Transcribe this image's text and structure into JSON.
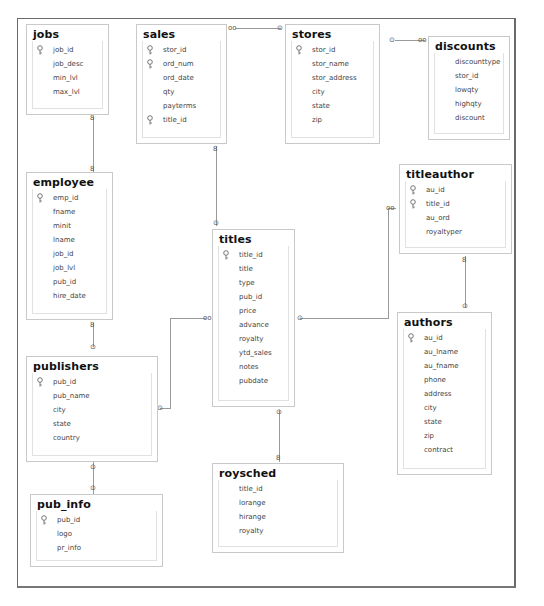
{
  "diagram": {
    "type": "database-schema",
    "tables": [
      {
        "id": "jobs",
        "name": "jobs",
        "columns": [
          {
            "name": "job_id",
            "pk": true
          },
          {
            "name": "job_desc",
            "pk": false
          },
          {
            "name": "min_lvl",
            "pk": false
          },
          {
            "name": "max_lvl",
            "pk": false
          }
        ]
      },
      {
        "id": "sales",
        "name": "sales",
        "columns": [
          {
            "name": "stor_id",
            "pk": true
          },
          {
            "name": "ord_num",
            "pk": true
          },
          {
            "name": "ord_date",
            "pk": false
          },
          {
            "name": "qty",
            "pk": false
          },
          {
            "name": "payterms",
            "pk": false
          },
          {
            "name": "title_id",
            "pk": true
          }
        ]
      },
      {
        "id": "stores",
        "name": "stores",
        "columns": [
          {
            "name": "stor_id",
            "pk": true
          },
          {
            "name": "stor_name",
            "pk": false
          },
          {
            "name": "stor_address",
            "pk": false
          },
          {
            "name": "city",
            "pk": false
          },
          {
            "name": "state",
            "pk": false
          },
          {
            "name": "zip",
            "pk": false
          }
        ]
      },
      {
        "id": "discounts",
        "name": "discounts",
        "columns": [
          {
            "name": "discounttype",
            "pk": false
          },
          {
            "name": "stor_id",
            "pk": false
          },
          {
            "name": "lowqty",
            "pk": false
          },
          {
            "name": "highqty",
            "pk": false
          },
          {
            "name": "discount",
            "pk": false
          }
        ]
      },
      {
        "id": "employee",
        "name": "employee",
        "columns": [
          {
            "name": "emp_id",
            "pk": true
          },
          {
            "name": "fname",
            "pk": false
          },
          {
            "name": "minit",
            "pk": false
          },
          {
            "name": "lname",
            "pk": false
          },
          {
            "name": "job_id",
            "pk": false
          },
          {
            "name": "job_lvl",
            "pk": false
          },
          {
            "name": "pub_id",
            "pk": false
          },
          {
            "name": "hire_date",
            "pk": false
          }
        ]
      },
      {
        "id": "titles",
        "name": "titles",
        "columns": [
          {
            "name": "title_id",
            "pk": true
          },
          {
            "name": "title",
            "pk": false
          },
          {
            "name": "type",
            "pk": false
          },
          {
            "name": "pub_id",
            "pk": false
          },
          {
            "name": "price",
            "pk": false
          },
          {
            "name": "advance",
            "pk": false
          },
          {
            "name": "royalty",
            "pk": false
          },
          {
            "name": "ytd_sales",
            "pk": false
          },
          {
            "name": "notes",
            "pk": false
          },
          {
            "name": "pubdate",
            "pk": false
          }
        ]
      },
      {
        "id": "titleauthor",
        "name": "titleauthor",
        "columns": [
          {
            "name": "au_id",
            "pk": true
          },
          {
            "name": "title_id",
            "pk": true
          },
          {
            "name": "au_ord",
            "pk": false
          },
          {
            "name": "royaltyper",
            "pk": false
          }
        ]
      },
      {
        "id": "authors",
        "name": "authors",
        "columns": [
          {
            "name": "au_id",
            "pk": true
          },
          {
            "name": "au_lname",
            "pk": false
          },
          {
            "name": "au_fname",
            "pk": false
          },
          {
            "name": "phone",
            "pk": false
          },
          {
            "name": "address",
            "pk": false
          },
          {
            "name": "city",
            "pk": false
          },
          {
            "name": "state",
            "pk": false
          },
          {
            "name": "zip",
            "pk": false
          },
          {
            "name": "contract",
            "pk": false
          }
        ]
      },
      {
        "id": "publishers",
        "name": "publishers",
        "columns": [
          {
            "name": "pub_id",
            "pk": true
          },
          {
            "name": "pub_name",
            "pk": false
          },
          {
            "name": "city",
            "pk": false
          },
          {
            "name": "state",
            "pk": false
          },
          {
            "name": "country",
            "pk": false
          }
        ]
      },
      {
        "id": "roysched",
        "name": "roysched",
        "columns": [
          {
            "name": "title_id",
            "pk": false
          },
          {
            "name": "lorange",
            "pk": false
          },
          {
            "name": "hirange",
            "pk": false
          },
          {
            "name": "royalty",
            "pk": false
          }
        ]
      },
      {
        "id": "pub_info",
        "name": "pub_info",
        "columns": [
          {
            "name": "pub_id",
            "pk": true
          },
          {
            "name": "logo",
            "pk": false
          },
          {
            "name": "pr_info",
            "pk": false
          }
        ]
      }
    ],
    "relationships": [
      {
        "from": "sales",
        "to": "stores",
        "many_end": "sales",
        "one_end": "stores"
      },
      {
        "from": "discounts",
        "to": "stores",
        "many_end": "discounts",
        "one_end": "stores"
      },
      {
        "from": "employee",
        "to": "jobs",
        "many_end": "employee",
        "one_end": "jobs"
      },
      {
        "from": "sales",
        "to": "titles",
        "many_end": "sales",
        "one_end": "titles"
      },
      {
        "from": "employee",
        "to": "publishers",
        "many_end": "employee",
        "one_end": "publishers"
      },
      {
        "from": "titles",
        "to": "publishers",
        "many_end": "titles",
        "one_end": "publishers"
      },
      {
        "from": "titleauthor",
        "to": "titles",
        "many_end": "titleauthor",
        "one_end": "titles"
      },
      {
        "from": "titleauthor",
        "to": "authors",
        "many_end": "titleauthor",
        "one_end": "authors"
      },
      {
        "from": "roysched",
        "to": "titles",
        "many_end": "roysched",
        "one_end": "titles"
      },
      {
        "from": "pub_info",
        "to": "publishers",
        "many_end": "pub_info",
        "one_end": "publishers"
      }
    ],
    "symbols": {
      "many": "∞",
      "one": "⚷"
    },
    "colors": {
      "frame": "#6a6a6a",
      "table_border": "#c9c9c9",
      "connector": "#9a9a9a",
      "text": "#444444",
      "title": "#111111"
    }
  }
}
